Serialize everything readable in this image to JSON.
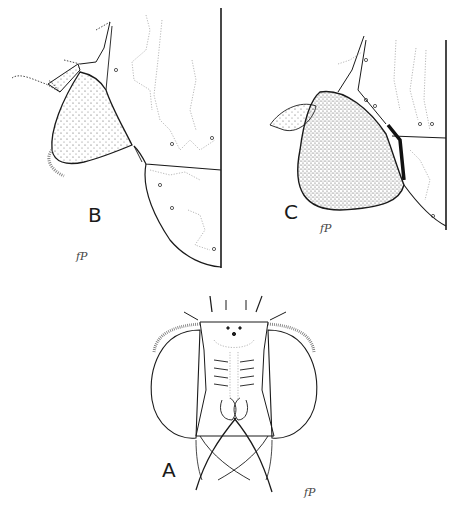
{
  "figure": {
    "panels": [
      {
        "id": "B",
        "label": "B",
        "monogram": "fP"
      },
      {
        "id": "C",
        "label": "C",
        "monogram": "fP"
      },
      {
        "id": "A",
        "label": "A",
        "monogram": "fP"
      }
    ],
    "colors": {
      "ink": "#1a1a1a",
      "stipple": "#555555",
      "faint": "#9a9a9a",
      "background": "#ffffff"
    }
  }
}
